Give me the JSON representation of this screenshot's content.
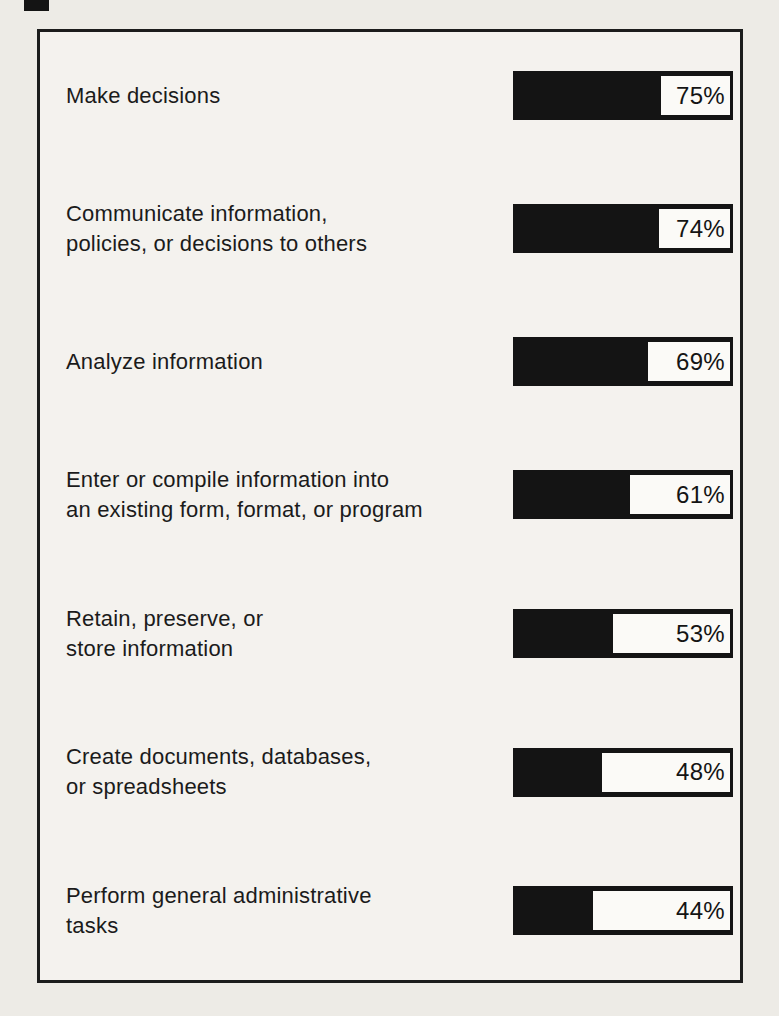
{
  "page": {
    "background_color": "#edebe6",
    "frame_background_color": "#f4f2ee",
    "frame_border_color": "#1c1c1c"
  },
  "chart_data": {
    "type": "bar",
    "orientation": "horizontal",
    "unit": "%",
    "value_range": [
      0,
      100
    ],
    "grid": false,
    "legend": false,
    "title": "",
    "xlabel": "",
    "ylabel": "",
    "bar_style": {
      "fill_color": "#141414",
      "value_box_background": "#fbfaf7",
      "value_box_border": "#141414"
    },
    "rows": [
      {
        "label": "Make decisions",
        "value": 75,
        "value_label": "75%"
      },
      {
        "label": "Communicate information,\npolicies, or decisions to others",
        "value": 74,
        "value_label": "74%"
      },
      {
        "label": "Analyze information",
        "value": 69,
        "value_label": "69%"
      },
      {
        "label": "Enter or compile information into\nan existing form, format, or program",
        "value": 61,
        "value_label": "61%"
      },
      {
        "label": "Retain, preserve, or\nstore information",
        "value": 53,
        "value_label": "53%"
      },
      {
        "label": "Create documents, databases,\nor spreadsheets",
        "value": 48,
        "value_label": "48%"
      },
      {
        "label": "Perform general administrative\ntasks",
        "value": 44,
        "value_label": "44%"
      }
    ]
  }
}
